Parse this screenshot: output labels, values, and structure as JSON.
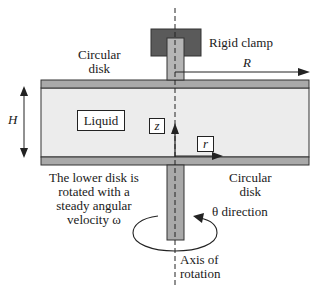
{
  "diagram": {
    "type": "rotating-disk-viscometer-schematic",
    "labels": {
      "upper_disk": [
        "Circular",
        "disk"
      ],
      "clamp": "Rigid clamp",
      "radius": "R",
      "height": "H",
      "liquid": "Liquid",
      "z_axis": "z",
      "r_axis": "r",
      "lower_disk": [
        "Circular",
        "disk"
      ],
      "caption": [
        "The lower disk is",
        "rotated with a",
        "steady angular",
        "velocity ω"
      ],
      "theta": "θ direction",
      "axis": [
        "Axis of",
        "rotation"
      ]
    },
    "colors": {
      "disk": "#a9a9a9",
      "liquid": "#ececec",
      "clamp": "#5a5a5a",
      "rod": "#b5b5b5",
      "line": "#1a1a1a"
    }
  }
}
